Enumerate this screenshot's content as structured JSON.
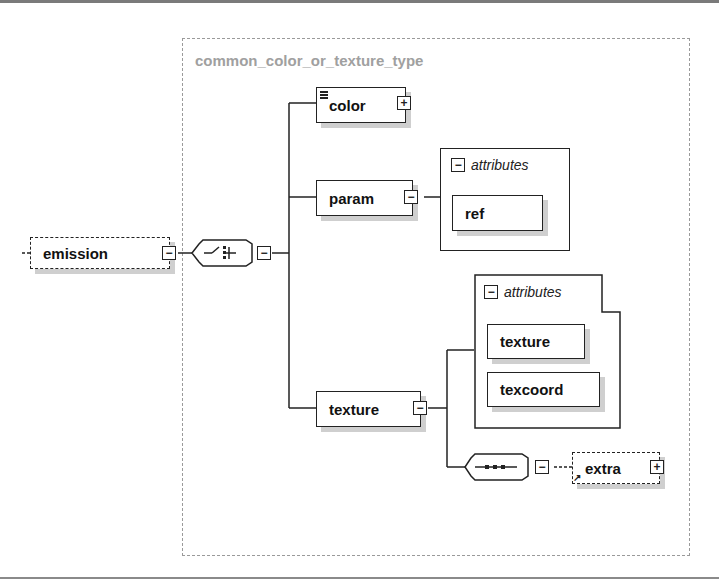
{
  "diagram": {
    "group": {
      "title": "common_color_or_texture_type"
    },
    "root": {
      "label": "emission",
      "expander": "−",
      "optional": true
    },
    "choice": {
      "icon": "choice-compositor",
      "expander": "−"
    },
    "elements": [
      {
        "id": "color",
        "label": "color",
        "expander": "+",
        "has_docs": true
      },
      {
        "id": "param",
        "label": "param",
        "expander": "−"
      },
      {
        "id": "texture",
        "label": "texture",
        "expander": "−"
      }
    ],
    "param_attributes": {
      "header": "attributes",
      "expander": "−",
      "items": [
        "ref"
      ]
    },
    "texture_attributes": {
      "header": "attributes",
      "expander": "−",
      "items": [
        "texture",
        "texcoord"
      ]
    },
    "sequence": {
      "icon": "sequence-compositor",
      "expander": "−"
    },
    "extra": {
      "label": "extra",
      "expander": "+",
      "optional": true,
      "is_reference": true
    },
    "colors": {
      "line": "#222222",
      "group_border": "#9a9a9a",
      "group_title": "#a0a0a0",
      "shadow": "#cfcfcf"
    }
  }
}
